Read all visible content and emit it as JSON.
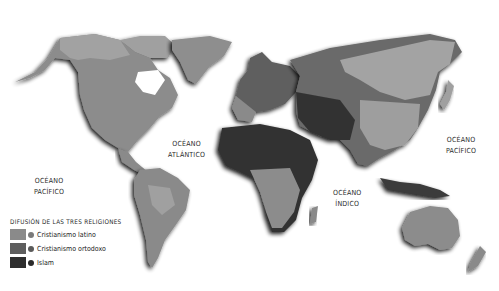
{
  "map": {
    "title": "Difusión de las tres religiones",
    "colors": {
      "background": "#ffffff",
      "cristianismo_latino": "#8a8a8a",
      "cristianismo_ortodoxo": "#6a6a6a",
      "islam": "#3a3a3a",
      "other_land": "#a8a8a8",
      "shadow": "#1c1c1c"
    },
    "ocean_labels": [
      {
        "line1": "OCÉANO",
        "line2": "PACÍFICO",
        "position": "west"
      },
      {
        "line1": "OCÉANO",
        "line2": "ATLÁNTICO",
        "position": "center"
      },
      {
        "line1": "OCÉANO",
        "line2": "ÍNDICO",
        "position": "south"
      },
      {
        "line1": "OCÉANO",
        "line2": "PACÍFICO",
        "position": "east"
      }
    ],
    "legend": {
      "title": "DIFUSIÓN DE LAS TRES RELIGIONES",
      "items": [
        {
          "label": "Cristianismo latino",
          "swatch": "#8a8a8a",
          "dot": "#7a7a7a"
        },
        {
          "label": "Cristianismo ortodoxo",
          "swatch": "#5e5e5e",
          "dot": "#5a5a5a"
        },
        {
          "label": "Islam",
          "swatch": "#2e2e2e",
          "dot": "#2a2a2a"
        }
      ]
    }
  }
}
